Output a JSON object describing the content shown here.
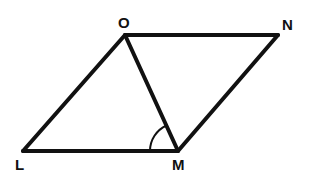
{
  "diagram": {
    "type": "parallelogram with diagonal",
    "vertices": {
      "O": {
        "label": "O",
        "x": 125,
        "y": 35,
        "label_x": 118,
        "label_y": 28
      },
      "N": {
        "label": "N",
        "x": 278,
        "y": 35,
        "label_x": 282,
        "label_y": 30
      },
      "L": {
        "label": "L",
        "x": 23,
        "y": 151,
        "label_x": 15,
        "label_y": 170
      },
      "M": {
        "label": "M",
        "x": 178,
        "y": 151,
        "label_x": 172,
        "label_y": 170
      }
    },
    "edges": [
      {
        "from": "L",
        "to": "O"
      },
      {
        "from": "O",
        "to": "N"
      },
      {
        "from": "N",
        "to": "M"
      },
      {
        "from": "M",
        "to": "L"
      },
      {
        "from": "O",
        "to": "M"
      }
    ],
    "marked_angle": {
      "vertex": "M",
      "between": [
        "L",
        "O"
      ],
      "label": "angle LMO"
    },
    "colors": {
      "stroke": "#111111",
      "background": "#ffffff"
    }
  }
}
